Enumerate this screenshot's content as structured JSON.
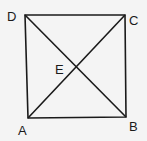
{
  "diagram": {
    "type": "square-with-diagonals",
    "background": "#f4f4f4",
    "stroke_color": "#1a1a1a",
    "vertices": {
      "A": {
        "label": "A",
        "x": 28,
        "y": 118
      },
      "B": {
        "label": "B",
        "x": 126,
        "y": 117
      },
      "C": {
        "label": "C",
        "x": 125,
        "y": 15
      },
      "D": {
        "label": "D",
        "x": 25,
        "y": 15
      }
    },
    "intersection": {
      "label": "E",
      "x": 77,
      "y": 67
    },
    "segments": [
      "AB",
      "BC",
      "CD",
      "DA",
      "AC",
      "BD"
    ]
  }
}
